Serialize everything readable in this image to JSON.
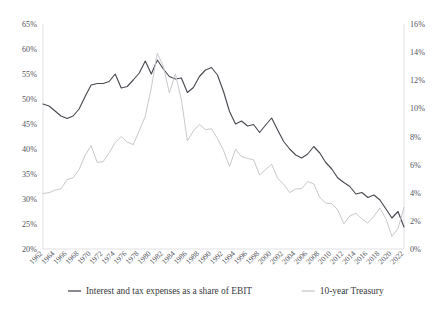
{
  "chart_data": {
    "type": "line",
    "title": "",
    "subtitle": "",
    "xlabel": "",
    "ylabel": "",
    "grid": false,
    "legend_position": "bottom",
    "x": [
      1962,
      1963,
      1964,
      1965,
      1966,
      1967,
      1968,
      1969,
      1970,
      1971,
      1972,
      1973,
      1974,
      1975,
      1976,
      1977,
      1978,
      1979,
      1980,
      1981,
      1982,
      1983,
      1984,
      1985,
      1986,
      1987,
      1988,
      1989,
      1990,
      1991,
      1992,
      1993,
      1994,
      1995,
      1996,
      1997,
      1998,
      1999,
      2000,
      2001,
      2002,
      2003,
      2004,
      2005,
      2006,
      2007,
      2008,
      2009,
      2010,
      2011,
      2012,
      2013,
      2014,
      2015,
      2016,
      2017,
      2018,
      2019,
      2020,
      2021,
      2022
    ],
    "x_tick_labels": [
      "1962",
      "1964",
      "1966",
      "1968",
      "1970",
      "1972",
      "1974",
      "1976",
      "1978",
      "1980",
      "1982",
      "1984",
      "1986",
      "1988",
      "1990",
      "1992",
      "1994",
      "1996",
      "1998",
      "2000",
      "2002",
      "2004",
      "2006",
      "2008",
      "2010",
      "2012",
      "2014",
      "2016",
      "2018",
      "2020",
      "2022"
    ],
    "left_axis": {
      "label": "",
      "ylim": [
        20,
        65
      ],
      "tick_step": 5,
      "tick_labels": [
        "20%",
        "25%",
        "30%",
        "35%",
        "40%",
        "45%",
        "50%",
        "55%",
        "60%",
        "65%"
      ],
      "unit": "%"
    },
    "right_axis": {
      "label": "",
      "ylim": [
        0,
        16
      ],
      "tick_step": 2,
      "tick_labels": [
        "0%",
        "2%",
        "4%",
        "6%",
        "8%",
        "10%",
        "12%",
        "14%",
        "16%"
      ],
      "unit": "%"
    },
    "series": [
      {
        "name": "Interest and tax expenses as a share of EBIT",
        "axis": "left",
        "color": "#4a4a52",
        "values": [
          49.0,
          48.6,
          47.6,
          46.6,
          46.1,
          46.6,
          48.0,
          50.5,
          52.8,
          53.1,
          53.1,
          53.5,
          55.0,
          52.2,
          52.5,
          53.8,
          55.2,
          57.6,
          55.0,
          57.8,
          56.0,
          54.5,
          54.0,
          54.2,
          51.3,
          52.3,
          54.5,
          55.8,
          56.3,
          54.8,
          51.5,
          47.5,
          45.0,
          45.6,
          44.6,
          44.9,
          43.3,
          44.8,
          46.2,
          43.8,
          41.5,
          40.0,
          38.8,
          38.2,
          39.0,
          40.5,
          39.2,
          37.3,
          36.0,
          34.2,
          33.3,
          32.5,
          31.0,
          31.3,
          30.3,
          30.8,
          29.8,
          28.0,
          26.2,
          27.5,
          24.4
        ]
      },
      {
        "name": "10-year Treasury",
        "axis": "right",
        "color": "#c9c9ce",
        "values": [
          3.95,
          4.0,
          4.19,
          4.28,
          4.93,
          5.07,
          5.65,
          6.67,
          7.35,
          6.16,
          6.21,
          6.85,
          7.56,
          7.99,
          7.61,
          7.42,
          8.41,
          9.44,
          11.46,
          13.92,
          13.0,
          11.1,
          12.46,
          10.62,
          7.68,
          8.39,
          8.85,
          8.49,
          8.55,
          7.86,
          7.01,
          5.87,
          7.09,
          6.57,
          6.44,
          6.35,
          5.26,
          5.65,
          6.03,
          5.02,
          4.61,
          4.01,
          4.27,
          4.29,
          4.8,
          4.63,
          3.66,
          3.26,
          3.22,
          2.78,
          1.8,
          2.35,
          2.54,
          2.14,
          1.84,
          2.33,
          2.91,
          2.14,
          0.89,
          1.45,
          2.95
        ]
      }
    ],
    "legend": [
      {
        "label": "Interest and tax expenses as a share of EBIT",
        "color": "#4a4a52"
      },
      {
        "label": "10-year Treasury",
        "color": "#c9c9ce"
      }
    ]
  }
}
